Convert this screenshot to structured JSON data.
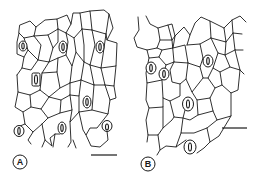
{
  "figure": {
    "panels": [
      {
        "label": "A",
        "label_pos": [
          20,
          162
        ],
        "scale_bar": {
          "x1": 91,
          "x2": 117,
          "y": 155
        },
        "stomata": [
          {
            "cx": 23,
            "cy": 46,
            "rx": 4,
            "ry": 5
          },
          {
            "cx": 63,
            "cy": 47,
            "rx": 4,
            "ry": 6
          },
          {
            "cx": 100,
            "cy": 47,
            "rx": 4,
            "ry": 6
          },
          {
            "cx": 36,
            "cy": 80,
            "rx": 4,
            "ry": 6
          },
          {
            "cx": 87,
            "cy": 102,
            "rx": 4,
            "ry": 6
          },
          {
            "cx": 19,
            "cy": 131,
            "rx": 5,
            "ry": 5
          },
          {
            "cx": 62,
            "cy": 128,
            "rx": 4,
            "ry": 6
          },
          {
            "cx": 107,
            "cy": 126,
            "rx": 5,
            "ry": 5
          }
        ]
      },
      {
        "label": "B",
        "label_pos": [
          148,
          164
        ],
        "scale_bar": {
          "x1": 222,
          "x2": 247,
          "y": 128
        },
        "stomata": [
          {
            "cx": 151,
            "cy": 68,
            "rx": 5,
            "ry": 6
          },
          {
            "cx": 164,
            "cy": 74,
            "rx": 5,
            "ry": 6
          },
          {
            "cx": 208,
            "cy": 61,
            "rx": 5,
            "ry": 6
          },
          {
            "cx": 188,
            "cy": 104,
            "rx": 5,
            "ry": 7
          },
          {
            "cx": 190,
            "cy": 147,
            "rx": 6,
            "ry": 7
          }
        ]
      }
    ]
  }
}
